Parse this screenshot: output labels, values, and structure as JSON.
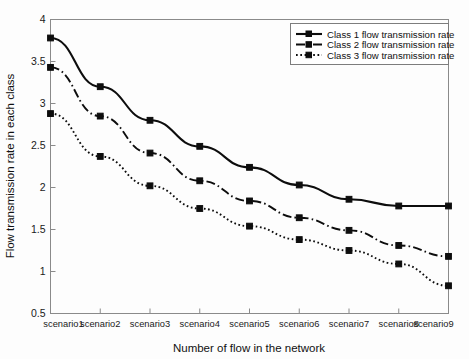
{
  "chart_data": {
    "type": "line",
    "title": "",
    "xlabel": "Number of flow in the network",
    "ylabel": "Flow transmission rate in each class",
    "categories": [
      "scenario1",
      "scenario2",
      "scenario3",
      "scenario4",
      "scenario5",
      "scenario6",
      "scenario7",
      "scenario8",
      "scenario9"
    ],
    "ylim": [
      0.5,
      4
    ],
    "yticks": [
      "0.5",
      "1",
      "1.5",
      "2",
      "2.5",
      "3",
      "3.5",
      "4"
    ],
    "ytick_values": [
      0.5,
      1,
      1.5,
      2,
      2.5,
      3,
      3.5,
      4
    ],
    "grid": false,
    "legend_position": "top-right",
    "series": [
      {
        "name": "Class 1 flow transmission rate",
        "style": "solid",
        "marker": "square",
        "color": "#0d0d0d",
        "values": [
          3.78,
          3.2,
          2.8,
          2.49,
          2.24,
          2.03,
          1.86,
          1.78,
          1.78
        ]
      },
      {
        "name": "Class 2 flow transmission rate",
        "style": "dash-dot",
        "marker": "square",
        "color": "#0d0d0d",
        "values": [
          3.43,
          2.85,
          2.41,
          2.08,
          1.84,
          1.64,
          1.49,
          1.31,
          1.18
        ]
      },
      {
        "name": "Class 3 flow transmission rate",
        "style": "dotted",
        "marker": "square",
        "color": "#0d0d0d",
        "values": [
          2.88,
          2.37,
          2.02,
          1.75,
          1.54,
          1.38,
          1.25,
          1.09,
          0.83
        ]
      }
    ]
  },
  "axes": {
    "x_title": "Number of flow in the network",
    "y_title": "Flow transmission rate in each class"
  },
  "legend": {
    "items": [
      "Class 1 flow transmission rate",
      "Class 2 flow transmission rate",
      "Class 3 flow transmission rate"
    ]
  }
}
